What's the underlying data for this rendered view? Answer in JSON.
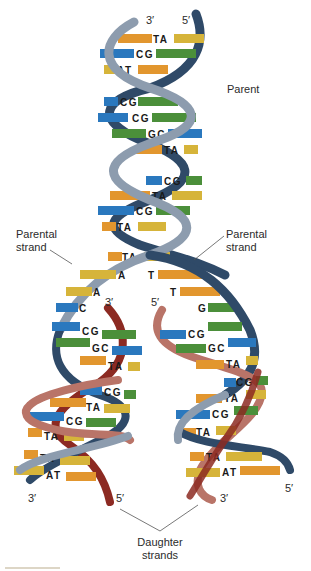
{
  "diagram": {
    "labels": {
      "parent": "Parent",
      "parental_strand_left_line1": "Parental",
      "parental_strand_left_line2": "strand",
      "parental_strand_right_line1": "Parental",
      "parental_strand_right_line2": "strand",
      "daughter_strands_line1": "Daughter",
      "daughter_strands_line2": "strands"
    },
    "strand_ends": {
      "top_left": "3′",
      "top_right": "5′",
      "fork_left": "3′",
      "fork_right": "5′",
      "bottom_left_daughter_left": "3′",
      "bottom_left_daughter_right": "5′",
      "bottom_right_daughter_left": "3′",
      "bottom_right_daughter_right": "5′"
    },
    "parent_base_pairs": [
      "TA",
      "CG",
      "AT",
      "CG",
      "CG",
      "GC",
      "TA",
      "CG",
      "TA",
      "CG",
      "TA",
      "TA"
    ],
    "fork_unpaired_left": [
      "A",
      "A",
      "C"
    ],
    "fork_unpaired_right": [
      "T",
      "T",
      "G"
    ],
    "left_daughter_base_pairs": [
      "CG",
      "GC",
      "TA",
      "CG",
      "TA",
      "CG",
      "TA",
      "TA",
      "AT"
    ],
    "right_daughter_base_pairs": [
      "CG",
      "GC",
      "TA",
      "CG",
      "TA",
      "CG",
      "TA",
      "TA",
      "AT"
    ],
    "colors": {
      "parental_strand_light": "#8d9cae",
      "parental_strand_dark": "#2f4a68",
      "daughter_strand_light": "#b97468",
      "daughter_strand_dark": "#8c2a22",
      "base_T": "#d6b43a",
      "base_A": "#e2962e",
      "base_C": "#2a78be",
      "base_G": "#4b8f3a",
      "text": "#1a1a1a"
    }
  }
}
